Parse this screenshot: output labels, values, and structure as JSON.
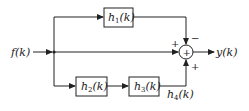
{
  "diagram": {
    "input": {
      "label": "f(k)"
    },
    "output": {
      "label": "y(k)"
    },
    "blocks": [
      {
        "id": "h1",
        "name": "h",
        "sub": "1",
        "arg": "(k)"
      },
      {
        "id": "h2",
        "name": "h",
        "sub": "2",
        "arg": "(k)"
      },
      {
        "id": "h3",
        "name": "h",
        "sub": "3",
        "arg": "(k)"
      }
    ],
    "summer": {
      "symbol": "+",
      "signs": {
        "left": "+",
        "top": "−",
        "bottom": "+"
      }
    },
    "annotations": [
      {
        "label_name": "h",
        "label_sub": "4",
        "label_arg": "(k)"
      }
    ]
  }
}
